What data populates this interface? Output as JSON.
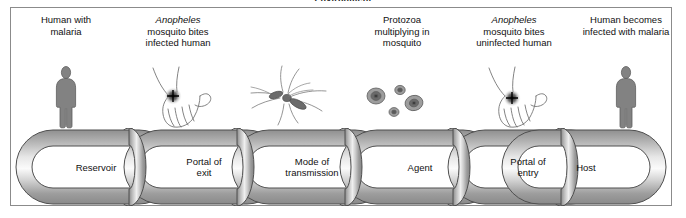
{
  "figure": {
    "environment_caption": "Environment",
    "background_color": "#ffffff",
    "frame_color": "#8b8b8b",
    "link_fill_light": "#f2f2f2",
    "link_fill_dark": "#9a9a9a",
    "figure_color": "#808080"
  },
  "stages": [
    {
      "id": "stage-reservoir",
      "caption_line1": "Human with",
      "caption_line2": "malaria",
      "caption_italic": "",
      "icon": "human-figure-icon"
    },
    {
      "id": "stage-portal-of-exit",
      "caption_italic": "Anopheles",
      "caption_line1": "mosquito bites",
      "caption_line2": "infected human",
      "icon": "hand-with-bite-icon"
    },
    {
      "id": "stage-mode-of-transmission",
      "caption_italic": "",
      "caption_line1": "",
      "caption_line2": "",
      "icon": "mosquito-icon"
    },
    {
      "id": "stage-agent",
      "caption_italic": "",
      "caption_line1": "Protozoa",
      "caption_line2": "multiplying in",
      "caption_line3": "mosquito",
      "icon": "protozoa-cells-icon"
    },
    {
      "id": "stage-portal-of-entry",
      "caption_italic": "Anopheles",
      "caption_line1": "mosquito bites",
      "caption_line2": "uninfected human",
      "icon": "hand-with-bite-icon"
    },
    {
      "id": "stage-host",
      "caption_italic": "",
      "caption_line1": "Human becomes",
      "caption_line2": "infected with malaria",
      "icon": "human-figure-icon"
    }
  ],
  "chain": {
    "links": [
      {
        "id": "link-reservoir",
        "line1": "Reservoir",
        "line2": ""
      },
      {
        "id": "link-portal-of-exit",
        "line1": "Portal of",
        "line2": "exit"
      },
      {
        "id": "link-mode-of-transmission",
        "line1": "Mode of",
        "line2": "transmission"
      },
      {
        "id": "link-agent",
        "line1": "Agent",
        "line2": ""
      },
      {
        "id": "link-portal-of-entry",
        "line1": "Portal of",
        "line2": "entry"
      },
      {
        "id": "link-host",
        "line1": "Host",
        "line2": ""
      }
    ]
  }
}
